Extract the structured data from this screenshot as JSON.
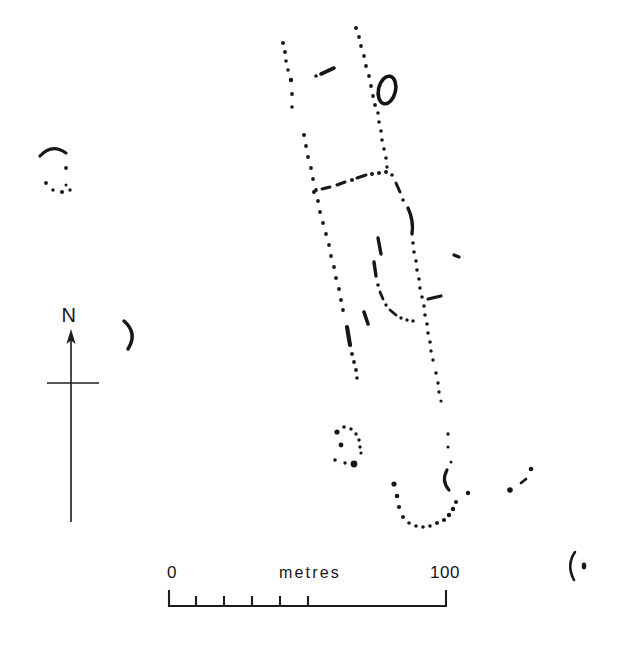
{
  "figure": {
    "kind": "archaeological-site-plan",
    "background_color": "#ffffff",
    "ink_color": "#171717",
    "width": 620,
    "height": 649
  },
  "north_arrow": {
    "label": "N",
    "label_x": 69,
    "label_y": 320,
    "shaft_x": 71,
    "shaft_top": 331,
    "shaft_bottom": 522,
    "crossbar_y": 383,
    "crossbar_left": 47,
    "crossbar_right": 99
  },
  "scale_bar": {
    "unit_label": "metres",
    "start_label": "0",
    "end_label": "100",
    "start_label_x": 172,
    "end_label_x": 443,
    "label_y": 578,
    "unit_label_x": 310,
    "bar_left": 168,
    "bar_right": 447,
    "bar_y": 606,
    "end_tick_height": 16,
    "minor_tick_height": 10,
    "minor_ticks": [
      0,
      10,
      20,
      30,
      40,
      50
    ],
    "max_value": 100
  },
  "features": [
    {
      "name": "northwest-ring-ditch-arc",
      "type": "arc"
    },
    {
      "name": "northwest-ring-ditch-dots",
      "type": "dot-group"
    },
    {
      "name": "crescent-enclosure-west",
      "type": "arc"
    },
    {
      "name": "north-linear-ditch-west",
      "type": "dot-line"
    },
    {
      "name": "north-linear-ditch-east",
      "type": "dot-line"
    },
    {
      "name": "short-diagonal-dash-north",
      "type": "dash"
    },
    {
      "name": "oval-ring-barrow",
      "type": "oval-ring"
    },
    {
      "name": "main-enclosure-west-boundary",
      "type": "dot-line"
    },
    {
      "name": "main-enclosure-cross-boundary",
      "type": "dot-line"
    },
    {
      "name": "main-enclosure-east-boundary",
      "type": "dot-line"
    },
    {
      "name": "inner-division-ditch",
      "type": "dot-line"
    },
    {
      "name": "southwest-trackway-ditch",
      "type": "dot-line"
    },
    {
      "name": "south-linear-ditch",
      "type": "dot-line"
    },
    {
      "name": "small-oval-ring-ditch-south",
      "type": "dot-ring"
    },
    {
      "name": "u-shaped-enclosure-south",
      "type": "dot-curve"
    },
    {
      "name": "curved-segment-south",
      "type": "arc"
    },
    {
      "name": "southeast-dot-cluster",
      "type": "dot-group"
    },
    {
      "name": "southeast-corner-arc",
      "type": "arc"
    },
    {
      "name": "isolated-dot-east",
      "type": "dot-group"
    }
  ]
}
